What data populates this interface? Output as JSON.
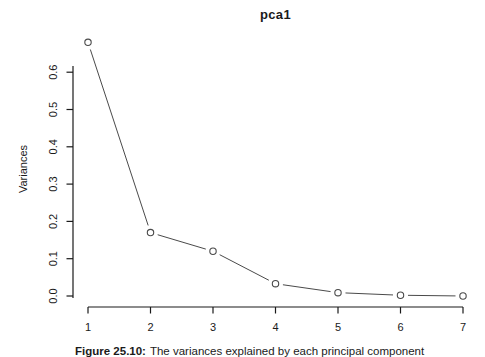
{
  "chart_data": {
    "type": "line",
    "title": "pca1",
    "xlabel": "",
    "ylabel": "Variances",
    "x": [
      1,
      2,
      3,
      4,
      5,
      6,
      7
    ],
    "values": [
      0.68,
      0.17,
      0.12,
      0.033,
      0.009,
      0.002,
      0.0
    ],
    "xticks": [
      "1",
      "2",
      "3",
      "4",
      "5",
      "6",
      "7"
    ],
    "yticks": [
      "0.0",
      "0.1",
      "0.2",
      "0.3",
      "0.4",
      "0.5",
      "0.6"
    ],
    "xlim": [
      1,
      7
    ],
    "ylim": [
      0,
      0.7
    ],
    "grid": false,
    "legend": "none",
    "marker": "open-circle",
    "line_color": "#4a4a4a",
    "marker_color": "#4a4a4a",
    "axis_color": "#1a1a1a",
    "text_color": "#1a1a1a",
    "background": "#ffffff"
  },
  "caption": {
    "label": "Figure 25.10:",
    "text": "The variances explained by each principal component"
  }
}
